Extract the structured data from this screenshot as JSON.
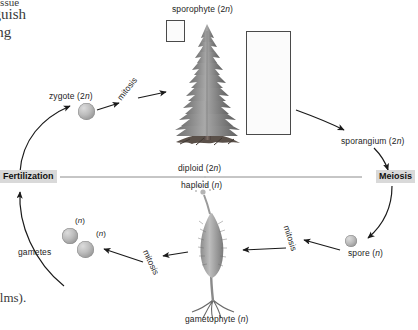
{
  "page": {
    "width": 418,
    "height": 330,
    "background": "#ffffff",
    "book_text": {
      "line_1": "tissue",
      "line_2": "nguish",
      "line_3": "ing",
      "caption": "elms)."
    }
  },
  "diagram": {
    "divider": {
      "above_label": "diploid (2n)",
      "below_label": "haploid (n)",
      "line_color": "#8c8c8c"
    },
    "phases": [
      {
        "name": "fertilization",
        "label": "Fertilization",
        "position": "left"
      },
      {
        "name": "meiosis",
        "label": "Meiosis",
        "position": "right"
      }
    ],
    "stages": [
      {
        "name": "zygote",
        "label": "zygote (2n)",
        "ploidy": "2n"
      },
      {
        "name": "sporophyte",
        "label": "sporophyte (2n)",
        "ploidy": "2n"
      },
      {
        "name": "sporangium",
        "label": "sporangium (2n)",
        "ploidy": "2n"
      },
      {
        "name": "spore",
        "label": "spore (n)",
        "ploidy": "n"
      },
      {
        "name": "gametophyte",
        "label": "gametophyte (n)",
        "ploidy": "n"
      },
      {
        "name": "gametes",
        "label": "gametes",
        "ploidy": "n"
      }
    ],
    "process_labels": [
      {
        "name": "mitosis-zygote-to-sporophyte",
        "label": "mitosis"
      },
      {
        "name": "mitosis-spore-to-gametophyte",
        "label": "mitosis"
      },
      {
        "name": "mitosis-gametophyte-to-gametes",
        "label": "mitosis"
      }
    ],
    "gamete_ploidy_marks": [
      {
        "name": "gamete-1-ploidy",
        "label": "(n)"
      },
      {
        "name": "gamete-2-ploidy",
        "label": "(n)"
      }
    ],
    "colors": {
      "phase_badge_bg": "#d9d9d9",
      "arrow": "#1a1a1a",
      "cell_fill": "#bdbdbd",
      "text": "#1d1d1d",
      "frame_border": "#4a4a4a"
    },
    "insets": [
      {
        "name": "sporophyte-detail-marker",
        "contents": "needle-leaf"
      },
      {
        "name": "sporangium-detail-panel",
        "contents": "sporangium-and-ovule"
      }
    ]
  }
}
